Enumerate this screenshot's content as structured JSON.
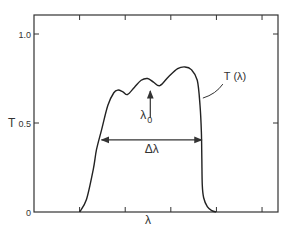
{
  "chart_data": {
    "type": "line",
    "title": "",
    "xlabel": "λ",
    "ylabel": "T",
    "xlim": [
      0,
      5.35
    ],
    "ylim": [
      0,
      1.0
    ],
    "x_ticks": [
      1,
      2,
      3,
      4,
      5
    ],
    "x_tick_labels": [
      "",
      "",
      "",
      "",
      ""
    ],
    "y_ticks": [
      0,
      0.5,
      1.0
    ],
    "y_tick_labels": [
      "0",
      "0.5",
      "1.0"
    ],
    "grid": false,
    "series": [
      {
        "name": "T(λ)",
        "x": [
          1.0,
          1.15,
          1.3,
          1.37,
          1.48,
          1.62,
          1.75,
          1.84,
          1.95,
          2.05,
          2.2,
          2.35,
          2.49,
          2.62,
          2.76,
          2.95,
          3.15,
          3.31,
          3.45,
          3.58,
          3.64,
          3.67,
          3.68,
          3.69,
          3.72,
          3.8,
          3.9,
          3.99
        ],
        "y": [
          0.0,
          0.07,
          0.24,
          0.35,
          0.46,
          0.6,
          0.67,
          0.685,
          0.675,
          0.66,
          0.7,
          0.74,
          0.75,
          0.73,
          0.71,
          0.76,
          0.805,
          0.815,
          0.8,
          0.74,
          0.6,
          0.45,
          0.3,
          0.15,
          0.08,
          0.03,
          0.008,
          0.0
        ]
      }
    ],
    "annotations": [
      {
        "text": "T (λ)",
        "type": "label-with-leader",
        "points_to": [
          3.68,
          0.64
        ]
      },
      {
        "text": "λ",
        "subscript": "0",
        "type": "arrow-up",
        "x": 2.55,
        "y_from": 0.53,
        "y_to": 0.68
      },
      {
        "text": "Δλ",
        "type": "double-arrow",
        "x_from": 1.48,
        "x_to": 3.68,
        "y": 0.405
      }
    ]
  }
}
